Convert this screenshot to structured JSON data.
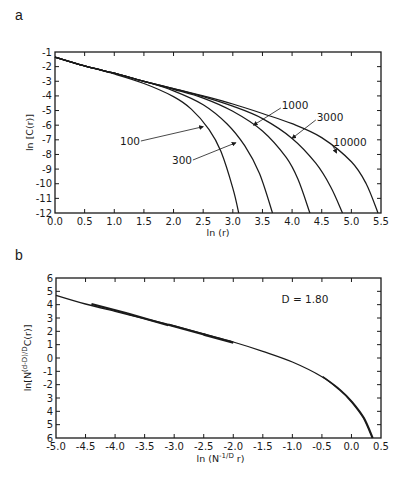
{
  "chart_data": [
    {
      "panel": "a",
      "type": "line",
      "title": "",
      "xlabel": "ln (r)",
      "ylabel": "ln [C(r)]",
      "xlim": [
        0.0,
        5.5
      ],
      "ylim": [
        -12,
        -1
      ],
      "xticks": [
        "0.0",
        "0.5",
        "1.0",
        "1.5",
        "2.0",
        "2.5",
        "3.0",
        "3.5",
        "4.0",
        "4.5",
        "5.0",
        "5.5"
      ],
      "yticks": [
        "-1",
        "-2",
        "-3",
        "-4",
        "-5",
        "-6",
        "-7",
        "-8",
        "-9",
        "-10",
        "-11",
        "-12"
      ],
      "grid": false,
      "legend": "inline annotations with arrows",
      "series": [
        {
          "name": "100",
          "x": [
            0.0,
            0.5,
            1.0,
            1.5,
            2.0,
            2.3,
            2.6,
            2.8,
            3.0,
            3.1
          ],
          "y": [
            -1.35,
            -1.95,
            -2.5,
            -3.15,
            -4.05,
            -4.9,
            -6.3,
            -7.8,
            -10.3,
            -12.0
          ]
        },
        {
          "name": "300",
          "x": [
            0.0,
            0.5,
            1.0,
            1.5,
            2.0,
            2.5,
            2.9,
            3.2,
            3.45,
            3.67
          ],
          "y": [
            -1.35,
            -1.95,
            -2.45,
            -3.0,
            -3.65,
            -4.6,
            -5.9,
            -7.4,
            -9.3,
            -12.0
          ]
        },
        {
          "name": "1000",
          "x": [
            0.0,
            0.5,
            1.0,
            1.5,
            2.0,
            2.5,
            3.0,
            3.5,
            3.9,
            4.1,
            4.3
          ],
          "y": [
            -1.35,
            -1.95,
            -2.45,
            -3.0,
            -3.55,
            -4.15,
            -5.05,
            -6.4,
            -8.2,
            -9.7,
            -12.0
          ]
        },
        {
          "name": "3000",
          "x": [
            0.0,
            0.5,
            1.0,
            1.5,
            2.0,
            2.5,
            3.0,
            3.5,
            4.0,
            4.4,
            4.65,
            4.85
          ],
          "y": [
            -1.35,
            -1.95,
            -2.45,
            -3.0,
            -3.5,
            -4.05,
            -4.7,
            -5.55,
            -6.9,
            -8.6,
            -10.2,
            -12.0
          ]
        },
        {
          "name": "10000",
          "x": [
            0.0,
            0.5,
            1.0,
            1.5,
            2.0,
            2.5,
            3.0,
            3.5,
            4.0,
            4.5,
            5.0,
            5.25,
            5.45
          ],
          "y": [
            -1.35,
            -1.95,
            -2.45,
            -3.0,
            -3.5,
            -4.0,
            -4.55,
            -5.2,
            -5.9,
            -6.85,
            -8.5,
            -10.0,
            -12.0
          ]
        }
      ],
      "annotations": [
        {
          "text": "100",
          "arrow_to": [
            2.5,
            -6.1
          ]
        },
        {
          "text": "300",
          "arrow_to": [
            3.05,
            -7.2
          ]
        },
        {
          "text": "1000",
          "arrow_to": [
            3.35,
            -6.0
          ]
        },
        {
          "text": "3000",
          "arrow_to": [
            4.0,
            -6.9
          ]
        },
        {
          "text": "10000",
          "arrow_to": [
            4.75,
            -7.9
          ]
        }
      ]
    },
    {
      "panel": "b",
      "type": "line",
      "title": "",
      "xlabel": "ln (N^-1/D r)",
      "ylabel": "ln[N^(d-D)/D C(r)]",
      "xlim": [
        -5.0,
        0.5
      ],
      "ylim": [
        -6,
        6
      ],
      "xticks": [
        "-5.0",
        "-4.5",
        "-4.0",
        "-3.5",
        "-3.0",
        "-2.5",
        "-2.0",
        "-1.5",
        "-1.0",
        "-0.5",
        "0.0",
        "0.5"
      ],
      "yticks": [
        "6",
        "5",
        "4",
        "3",
        "2",
        "1",
        "0",
        "-1",
        "-2",
        "3",
        "4",
        "5",
        "6"
      ],
      "grid": false,
      "annotations": [
        {
          "text": "D = 1.80",
          "position": "upper right"
        }
      ],
      "series": [
        {
          "name": "collapsed (all N)",
          "x": [
            -5.0,
            -4.5,
            -4.0,
            -3.5,
            -3.0,
            -2.5,
            -2.0,
            -1.5,
            -1.0,
            -0.5,
            -0.2,
            0.0,
            0.2,
            0.35
          ],
          "y": [
            4.7,
            4.05,
            3.5,
            2.95,
            2.4,
            1.8,
            1.2,
            0.5,
            -0.3,
            -1.4,
            -2.4,
            -3.3,
            -4.5,
            -6.0
          ]
        },
        {
          "name": "segment 10000",
          "x": [
            -4.4,
            -3.8
          ],
          "y": [
            4.05,
            3.4
          ]
        },
        {
          "name": "segment 3000",
          "x": [
            -3.8,
            -3.1
          ],
          "y": [
            3.35,
            2.5
          ]
        },
        {
          "name": "segment 1000",
          "x": [
            -3.1,
            -2.45
          ],
          "y": [
            2.5,
            1.75
          ]
        },
        {
          "name": "segment 300",
          "x": [
            -2.5,
            -2.0
          ],
          "y": [
            1.75,
            1.2
          ]
        }
      ]
    }
  ],
  "labels": {
    "panel_a": "a",
    "panel_b": "b",
    "a_xlabel": "ln (r)",
    "a_ylabel": "ln [C(r)]",
    "b_xlabel_main": "ln (N",
    "b_xlabel_sup": "-1/D",
    "b_xlabel_end": " r)",
    "b_ylabel_main": "ln[N",
    "b_ylabel_sup": "(d-D)/D",
    "b_ylabel_end": "C(r)]",
    "b_annotation": "D = 1.80"
  }
}
